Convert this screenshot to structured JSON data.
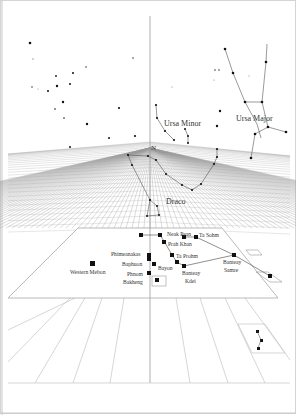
{
  "figure": {
    "constellations": [
      {
        "name": "Ursa Minor",
        "label_x": 164,
        "label_y": 126
      },
      {
        "name": "Ursa Major",
        "label_x": 237,
        "label_y": 121
      },
      {
        "name": "Draco",
        "label_x": 166,
        "label_y": 203
      }
    ],
    "north_label": "N",
    "temples": [
      {
        "name": "Neak Pean",
        "x": 165,
        "y": 236
      },
      {
        "name": "Ta Sohm",
        "x": 195,
        "y": 236
      },
      {
        "name": "Prah Khan",
        "x": 167,
        "y": 246
      },
      {
        "name": "Ta Prohm",
        "x": 176,
        "y": 257
      },
      {
        "name": "Phimeanakas",
        "x": 97,
        "y": 255
      },
      {
        "name": "Baphuon",
        "x": 122,
        "y": 265
      },
      {
        "name": "Bayon",
        "x": 158,
        "y": 269
      },
      {
        "name": "Phnom",
        "x": 128,
        "y": 275
      },
      {
        "name": "Bakheng",
        "x": 122,
        "y": 283
      },
      {
        "name": "Banteay",
        "x": 184,
        "y": 274
      },
      {
        "name": "Kdei",
        "x": 187,
        "y": 283
      },
      {
        "name": "Banteay",
        "x": 225,
        "y": 264
      },
      {
        "name": "Samre",
        "x": 224,
        "y": 272
      },
      {
        "name": "Western Mebon",
        "x": 70,
        "y": 273
      }
    ],
    "labels": {
      "neak_pean": "Neak Pean",
      "ta_sohm": "Ta Sohm",
      "prah_khan": "Prah Khan",
      "ta_prohm": "Ta Prohm",
      "phimeanakas": "Phimeanakas",
      "baphuon": "Baphuon",
      "bayon": "Bayon",
      "phnom": "Phnom",
      "bakheng": "Bakheng",
      "banteay_kdei_1": "Banteay",
      "banteay_kdei_2": "Kdei",
      "banteay_samre_1": "Banteay",
      "banteay_samre_2": "Samre",
      "western_mebon": "Western Mebon",
      "ursa_minor": "Ursa Minor",
      "ursa_major": "Ursa Major",
      "draco": "Draco",
      "north": "N"
    },
    "colors": {
      "ink": "#111111",
      "grid": "#bdbdbd",
      "text": "#333333",
      "frame": "#cfcfcf"
    }
  }
}
